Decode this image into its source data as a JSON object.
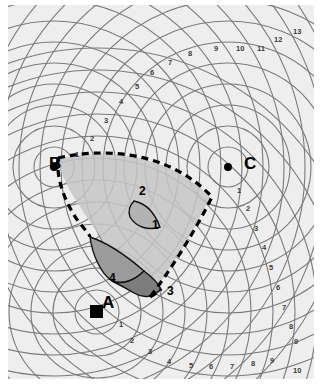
{
  "figure": {
    "type": "hyperbolic-navigation-lattice-chart",
    "background_color": "#eeeeee",
    "frame_color": "#ffffff",
    "grid_color": "#707070",
    "boundary_style": "dashed",
    "boundary_color": "#000000"
  },
  "stations": [
    {
      "id": "A",
      "label": "A",
      "marker": "filled-square",
      "x": 97,
      "y": 312,
      "label_x": 94,
      "label_y": 289
    },
    {
      "id": "B",
      "label": "B",
      "marker": "filled-dot",
      "x": 54,
      "y": 167,
      "label_x": 41,
      "label_y": 150
    },
    {
      "id": "C",
      "label": "C",
      "marker": "filled-dot",
      "x": 228,
      "y": 167,
      "label_x": 236,
      "label_y": 150
    }
  ],
  "regions": [
    {
      "id": "1",
      "label": "1",
      "fill": "#b0b0b0",
      "stroke": "#000000",
      "label_x": 144,
      "label_y": 214
    },
    {
      "id": "2",
      "label": "2",
      "fill": "#c4c4c4",
      "stroke": "none",
      "label_x": 146,
      "label_y": 188
    },
    {
      "id": "3",
      "label": "3",
      "fill": "#8a8a8a",
      "stroke": "#000000",
      "label_x": 159,
      "label_y": 280
    },
    {
      "id": "4",
      "label": "4",
      "fill": "#a0a0a0",
      "stroke": "#000000",
      "label_x": 101,
      "label_y": 267
    }
  ],
  "tick_labels": {
    "station_a_rings": [
      "1",
      "2",
      "3"
    ],
    "station_b_rings": [
      "1"
    ],
    "station_c_rings": [
      "1"
    ],
    "diagonal_from_b": [
      "1",
      "2",
      "3",
      "4",
      "5",
      "6",
      "7",
      "8"
    ],
    "top_right_lattice": [
      "8",
      "9",
      "10",
      "11",
      "12",
      "13"
    ],
    "right_edge_from_c": [
      "1",
      "2",
      "3",
      "4",
      "5",
      "6",
      "7",
      "8",
      "9"
    ],
    "bottom_edge": [
      "1",
      "2",
      "3",
      "4",
      "5",
      "6",
      "7",
      "8",
      "9",
      "10"
    ]
  },
  "annotations": [
    {
      "text": "B",
      "x": 41,
      "y": 150,
      "cls": "station"
    },
    {
      "text": "C",
      "x": 236,
      "y": 150,
      "cls": "station"
    },
    {
      "text": "A",
      "x": 94,
      "y": 289,
      "cls": "station"
    },
    {
      "text": "1",
      "x": 144,
      "y": 214,
      "cls": "region"
    },
    {
      "text": "2",
      "x": 131,
      "y": 180,
      "cls": "region"
    },
    {
      "text": "3",
      "x": 159,
      "y": 280,
      "cls": "region"
    },
    {
      "text": "4",
      "x": 101,
      "y": 267,
      "cls": "region"
    },
    {
      "text": "1",
      "x": 67,
      "y": 146,
      "cls": "tick"
    },
    {
      "text": "2",
      "x": 82,
      "y": 130,
      "cls": "tick"
    },
    {
      "text": "3",
      "x": 96,
      "y": 112,
      "cls": "tick"
    },
    {
      "text": "4",
      "x": 111,
      "y": 93,
      "cls": "tick"
    },
    {
      "text": "5",
      "x": 127,
      "y": 78,
      "cls": "tick"
    },
    {
      "text": "6",
      "x": 142,
      "y": 64,
      "cls": "tick"
    },
    {
      "text": "7",
      "x": 160,
      "y": 54,
      "cls": "tick"
    },
    {
      "text": "8",
      "x": 180,
      "y": 45,
      "cls": "tick"
    },
    {
      "text": "9",
      "x": 206,
      "y": 40,
      "cls": "tick"
    },
    {
      "text": "10",
      "x": 228,
      "y": 40,
      "cls": "tick"
    },
    {
      "text": "11",
      "x": 249,
      "y": 40,
      "cls": "tick"
    },
    {
      "text": "12",
      "x": 266,
      "y": 31,
      "cls": "tick"
    },
    {
      "text": "13",
      "x": 285,
      "y": 23,
      "cls": "tick"
    },
    {
      "text": "1",
      "x": 229,
      "y": 182,
      "cls": "tick"
    },
    {
      "text": "2",
      "x": 238,
      "y": 200,
      "cls": "tick"
    },
    {
      "text": "3",
      "x": 246,
      "y": 220,
      "cls": "tick"
    },
    {
      "text": "4",
      "x": 254,
      "y": 239,
      "cls": "tick"
    },
    {
      "text": "5",
      "x": 261,
      "y": 259,
      "cls": "tick"
    },
    {
      "text": "6",
      "x": 268,
      "y": 279,
      "cls": "tick"
    },
    {
      "text": "7",
      "x": 274,
      "y": 299,
      "cls": "tick"
    },
    {
      "text": "8",
      "x": 281,
      "y": 318,
      "cls": "tick"
    },
    {
      "text": "9",
      "x": 286,
      "y": 333,
      "cls": "tick"
    },
    {
      "text": "1",
      "x": 111,
      "y": 316,
      "cls": "tick"
    },
    {
      "text": "2",
      "x": 122,
      "y": 332,
      "cls": "tick"
    },
    {
      "text": "3",
      "x": 140,
      "y": 343,
      "cls": "tick"
    },
    {
      "text": "4",
      "x": 159,
      "y": 353,
      "cls": "tick"
    },
    {
      "text": "5",
      "x": 181,
      "y": 357,
      "cls": "tick"
    },
    {
      "text": "6",
      "x": 201,
      "y": 358,
      "cls": "tick"
    },
    {
      "text": "7",
      "x": 222,
      "y": 358,
      "cls": "tick"
    },
    {
      "text": "8",
      "x": 243,
      "y": 355,
      "cls": "tick"
    },
    {
      "text": "9",
      "x": 262,
      "y": 352,
      "cls": "tick"
    },
    {
      "text": "10",
      "x": 285,
      "y": 362,
      "cls": "tick"
    }
  ]
}
